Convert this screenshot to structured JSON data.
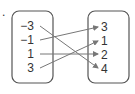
{
  "item_marker": ".",
  "diagram": {
    "type": "mapping",
    "domain_set": [
      "−3",
      "−1",
      "1",
      "3"
    ],
    "range_set": [
      "3",
      "1",
      "2",
      "4"
    ],
    "arrows": [
      {
        "from": "−3",
        "to": "4"
      },
      {
        "from": "−1",
        "to": "3"
      },
      {
        "from": "1",
        "to": "2"
      },
      {
        "from": "3",
        "to": "1"
      }
    ],
    "colors": {
      "box": "#555555",
      "arrow": "#777777",
      "text": "#333333"
    }
  }
}
